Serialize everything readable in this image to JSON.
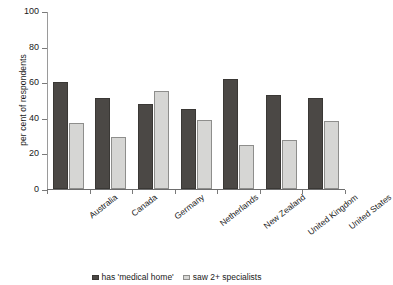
{
  "chart_data": {
    "type": "bar",
    "title": "",
    "subtitle": "",
    "xlabel": "",
    "ylabel": "per cent of respondents",
    "ylim": [
      0,
      100
    ],
    "yticks": [
      0,
      20,
      40,
      60,
      80,
      100
    ],
    "grid": false,
    "legend_position": "bottom",
    "categories": [
      "Australia",
      "Canada",
      "Germany",
      "Netherlands",
      "New Zealand",
      "United Kingdom",
      "United States"
    ],
    "series": [
      {
        "name": "has 'medical home'",
        "color": "#4b4845",
        "values": [
          60,
          51,
          48,
          45,
          62,
          53,
          51
        ]
      },
      {
        "name": "saw 2+ specialists",
        "color": "#d6d6d4",
        "values": [
          37,
          29,
          55,
          38.5,
          25,
          27.5,
          38
        ]
      }
    ]
  }
}
